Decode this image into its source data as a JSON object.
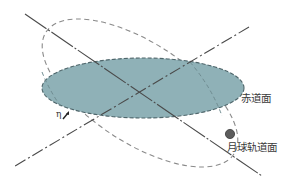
{
  "diagram": {
    "type": "geometry-illustration",
    "labels": {
      "equatorial_plane": "赤道面",
      "lunar_orbit_plane": "月球轨道面",
      "angle_symbol": "η"
    },
    "colors": {
      "equatorial_fill": "#8fb1b7",
      "equatorial_border": "#4f666b",
      "orbit_dash": "#8a8a8a",
      "axis_line": "#4a4a4a",
      "moon": "#5c5c5c",
      "text": "#3a3a3a"
    },
    "elements": [
      {
        "id": "equatorial-plane",
        "shape": "filled-ellipse",
        "label": "赤道面"
      },
      {
        "id": "lunar-orbit",
        "shape": "dashed-tilted-ellipse",
        "label": "月球轨道面"
      },
      {
        "id": "axis-a",
        "shape": "long-dash line"
      },
      {
        "id": "axis-b",
        "shape": "dash-dot line"
      },
      {
        "id": "moon",
        "shape": "dot"
      },
      {
        "id": "inclination-angle",
        "label": "η"
      }
    ]
  }
}
